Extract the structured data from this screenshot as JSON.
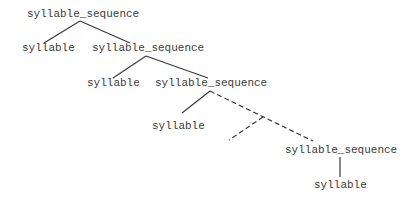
{
  "diagram": {
    "type": "parse-tree",
    "nodes": [
      {
        "id": "n0",
        "label": "syllable_sequence",
        "x": 27,
        "y": 8
      },
      {
        "id": "n1",
        "label": "syllable",
        "x": 22,
        "y": 42
      },
      {
        "id": "n2",
        "label": "syllable_sequence",
        "x": 92,
        "y": 42
      },
      {
        "id": "n3",
        "label": "syllable",
        "x": 87,
        "y": 77
      },
      {
        "id": "n4",
        "label": "syllable_sequence",
        "x": 155,
        "y": 77
      },
      {
        "id": "n5",
        "label": "syllable",
        "x": 152,
        "y": 120
      },
      {
        "id": "n6",
        "label": "syllable_sequence",
        "x": 285,
        "y": 144
      },
      {
        "id": "n7",
        "label": "syllable",
        "x": 314,
        "y": 179
      }
    ],
    "edges": [
      {
        "from": "n0",
        "to": "n1",
        "style": "solid",
        "x1": 80,
        "y1": 21,
        "x2": 44,
        "y2": 43
      },
      {
        "from": "n0",
        "to": "n2",
        "style": "solid",
        "x1": 80,
        "y1": 21,
        "x2": 130,
        "y2": 43
      },
      {
        "from": "n2",
        "to": "n3",
        "style": "solid",
        "x1": 146,
        "y1": 56,
        "x2": 113,
        "y2": 78
      },
      {
        "from": "n2",
        "to": "n4",
        "style": "solid",
        "x1": 146,
        "y1": 56,
        "x2": 208,
        "y2": 78
      },
      {
        "from": "n4",
        "to": "n5",
        "style": "solid",
        "x1": 210,
        "y1": 91,
        "x2": 182,
        "y2": 113
      },
      {
        "from": "n4",
        "to": "n6",
        "style": "dashed",
        "x1": 210,
        "y1": 91,
        "x2": 313,
        "y2": 141
      },
      {
        "from": "elided",
        "to": "elided-branch",
        "style": "dashed",
        "x1": 263,
        "y1": 117,
        "x2": 229,
        "y2": 140
      },
      {
        "from": "n6",
        "to": "n7",
        "style": "solid",
        "x1": 340,
        "y1": 157,
        "x2": 340,
        "y2": 177
      }
    ]
  }
}
